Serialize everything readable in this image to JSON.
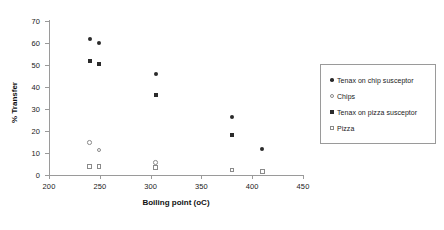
{
  "chart_data": {
    "type": "scatter",
    "title": "",
    "xlabel": "Boiling point (oC)",
    "ylabel": "% Transfer",
    "xlim": [
      200,
      450
    ],
    "ylim": [
      0,
      70
    ],
    "xticks": [
      200,
      250,
      300,
      350,
      400,
      450
    ],
    "yticks": [
      0,
      10,
      20,
      30,
      40,
      50,
      60,
      70
    ],
    "grid": false,
    "legend_position": "right",
    "series": [
      {
        "name": "Tenax on chip susceptor",
        "marker": "filled-circle",
        "color": "#2b2b2b",
        "points": [
          {
            "x": 240,
            "y": 62
          },
          {
            "x": 249,
            "y": 60
          },
          {
            "x": 305,
            "y": 46
          },
          {
            "x": 380,
            "y": 26.5
          },
          {
            "x": 410,
            "y": 12
          }
        ]
      },
      {
        "name": "Chips",
        "marker": "open-circle",
        "color": "#8a8a8a",
        "points": [
          {
            "x": 240,
            "y": 14.8
          },
          {
            "x": 249,
            "y": 11.3
          },
          {
            "x": 305,
            "y": 5.7
          }
        ]
      },
      {
        "name": "Tenax on pizza susceptor",
        "marker": "filled-square",
        "color": "#2b2b2b",
        "points": [
          {
            "x": 240,
            "y": 51.9
          },
          {
            "x": 249,
            "y": 50.4
          },
          {
            "x": 305,
            "y": 36.5
          },
          {
            "x": 380,
            "y": 18
          }
        ]
      },
      {
        "name": "Pizza",
        "marker": "open-square",
        "color": "#8a8a8a",
        "points": [
          {
            "x": 240,
            "y": 3.8
          },
          {
            "x": 249,
            "y": 3.8
          },
          {
            "x": 305,
            "y": 3.5
          },
          {
            "x": 380,
            "y": 2.3
          },
          {
            "x": 410,
            "y": 1.6
          }
        ]
      }
    ]
  }
}
